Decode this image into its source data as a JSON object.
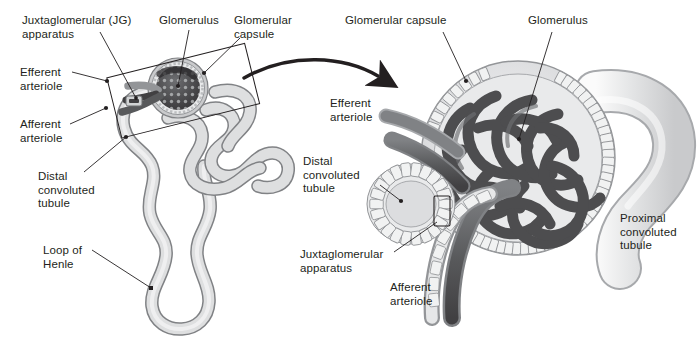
{
  "figure": {
    "background_color": "#ffffff",
    "text_color": "#231f20",
    "width": 698,
    "height": 340
  },
  "palette": {
    "tubule_fill": "#d9dadb",
    "tubule_fill_light": "#eceded",
    "tubule_outline": "#808285",
    "capsule_fill": "#c7c8ca",
    "capsule_inner": "#e6e7e8",
    "capillary_dark": "#58595b",
    "capillary_darker": "#414042",
    "glomerulus_dark": "#4d4d4f",
    "epithelium_fill": "#f1f2f2",
    "epithelium_outline": "#939598",
    "arrow_color": "#231f20",
    "leader_color": "#231f20"
  },
  "panels": {
    "left": {
      "name": "whole-nephron-overview",
      "callout_box": {
        "name": "magnification-callout-rectangle",
        "rotation_deg": -14
      }
    },
    "right": {
      "name": "magnified-renal-corpuscle"
    }
  },
  "arrow": {
    "name": "magnification-arrow",
    "direction": "left-to-right-curved"
  },
  "labels_left": [
    {
      "id": "jg-apparatus",
      "lines": [
        "Juxtaglomerular (JG)",
        "apparatus"
      ],
      "x": 22,
      "y": 14
    },
    {
      "id": "glomerulus",
      "lines": [
        "Glomerulus"
      ],
      "x": 159,
      "y": 14
    },
    {
      "id": "glomerular-capsule",
      "lines": [
        "Glomerular",
        "capsule"
      ],
      "x": 234,
      "y": 14
    },
    {
      "id": "efferent-arteriole",
      "lines": [
        "Efferent",
        "arteriole"
      ],
      "x": 20,
      "y": 66
    },
    {
      "id": "afferent-arteriole",
      "lines": [
        "Afferent",
        "arteriole"
      ],
      "x": 20,
      "y": 118
    },
    {
      "id": "distal-convoluted-tubule",
      "lines": [
        "Distal",
        "convoluted",
        "tubule"
      ],
      "x": 38,
      "y": 170
    },
    {
      "id": "loop-of-henle",
      "lines": [
        "Loop of",
        "Henle"
      ],
      "x": 43,
      "y": 244
    }
  ],
  "labels_right": [
    {
      "id": "glomerular-capsule",
      "lines": [
        "Glomerular capsule"
      ],
      "x": 345,
      "y": 14
    },
    {
      "id": "glomerulus",
      "lines": [
        "Glomerulus"
      ],
      "x": 528,
      "y": 14
    },
    {
      "id": "efferent-arteriole",
      "lines": [
        "Efferent",
        "arteriole"
      ],
      "x": 330,
      "y": 97
    },
    {
      "id": "distal-convoluted-tubule",
      "lines": [
        "Distal",
        "convoluted",
        "tubule"
      ],
      "x": 303,
      "y": 155
    },
    {
      "id": "juxtaglomerular-apparatus",
      "lines": [
        "Juxtaglomerular",
        "apparatus"
      ],
      "x": 300,
      "y": 248
    },
    {
      "id": "afferent-arteriole",
      "lines": [
        "Afferent",
        "arteriole"
      ],
      "x": 390,
      "y": 281
    },
    {
      "id": "proximal-convoluted-tubule",
      "lines": [
        "Proximal",
        "convoluted",
        "tubule"
      ],
      "x": 620,
      "y": 212
    }
  ]
}
